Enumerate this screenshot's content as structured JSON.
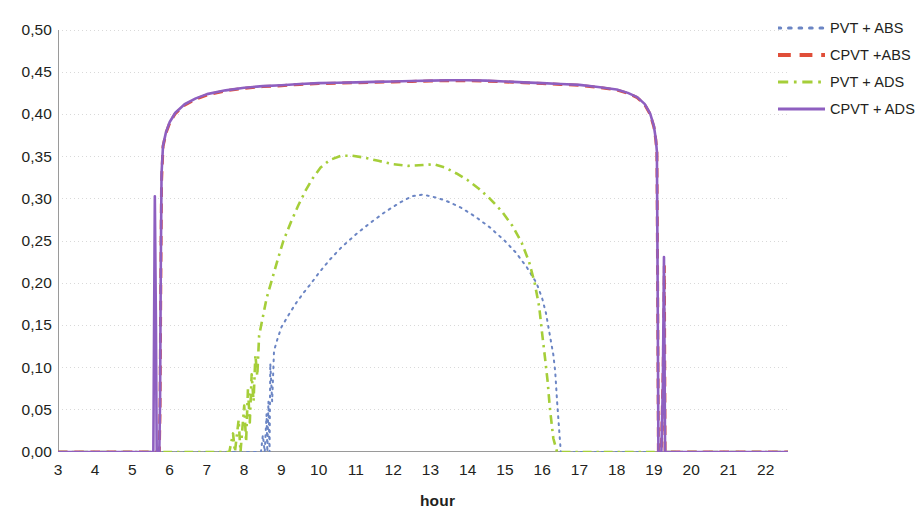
{
  "chart_data": {
    "type": "line",
    "title": "",
    "xlabel": "hour",
    "ylabel": "",
    "xlim": [
      3,
      22.6
    ],
    "ylim": [
      0,
      0.5
    ],
    "grid": true,
    "legend_position": "right",
    "decimal_separator": ",",
    "x_ticks": [
      3,
      4,
      5,
      6,
      7,
      8,
      9,
      10,
      11,
      12,
      13,
      14,
      15,
      16,
      17,
      18,
      19,
      20,
      21,
      22
    ],
    "x_tick_labels": [
      "3",
      "4",
      "5",
      "6",
      "7",
      "8",
      "9",
      "10",
      "11",
      "12",
      "13",
      "14",
      "15",
      "16",
      "17",
      "18",
      "19",
      "20",
      "21",
      "22"
    ],
    "x_minor_ticks_per_interval": 6,
    "y_ticks": [
      0.0,
      0.05,
      0.1,
      0.15,
      0.2,
      0.25,
      0.3,
      0.35,
      0.4,
      0.45,
      0.5
    ],
    "y_tick_labels": [
      "0,00",
      "0,05",
      "0,10",
      "0,15",
      "0,20",
      "0,25",
      "0,30",
      "0,35",
      "0,40",
      "0,45",
      "0,50"
    ],
    "series": [
      {
        "name": "PVT + ABS",
        "color": "#6b85c4",
        "style": "dotted",
        "width": 2.0,
        "points": [
          [
            3.0,
            0.0
          ],
          [
            5.0,
            0.0
          ],
          [
            6.0,
            0.0
          ],
          [
            7.0,
            0.0
          ],
          [
            8.0,
            0.0
          ],
          [
            8.45,
            0.0
          ],
          [
            8.5,
            0.02
          ],
          [
            8.55,
            0.0
          ],
          [
            8.6,
            0.045
          ],
          [
            8.62,
            0.0
          ],
          [
            8.65,
            0.06
          ],
          [
            8.68,
            0.0
          ],
          [
            8.7,
            0.105
          ],
          [
            8.75,
            0.06
          ],
          [
            8.8,
            0.12
          ],
          [
            8.9,
            0.135
          ],
          [
            9.0,
            0.148
          ],
          [
            9.2,
            0.163
          ],
          [
            9.4,
            0.177
          ],
          [
            9.6,
            0.189
          ],
          [
            9.8,
            0.2
          ],
          [
            10.0,
            0.212
          ],
          [
            10.3,
            0.228
          ],
          [
            10.6,
            0.242
          ],
          [
            11.0,
            0.258
          ],
          [
            11.4,
            0.272
          ],
          [
            11.8,
            0.285
          ],
          [
            12.2,
            0.296
          ],
          [
            12.5,
            0.303
          ],
          [
            12.8,
            0.305
          ],
          [
            13.1,
            0.302
          ],
          [
            13.4,
            0.298
          ],
          [
            13.8,
            0.29
          ],
          [
            14.2,
            0.279
          ],
          [
            14.6,
            0.266
          ],
          [
            15.0,
            0.25
          ],
          [
            15.3,
            0.236
          ],
          [
            15.6,
            0.218
          ],
          [
            15.85,
            0.2
          ],
          [
            16.0,
            0.182
          ],
          [
            16.1,
            0.165
          ],
          [
            16.2,
            0.14
          ],
          [
            16.3,
            0.115
          ],
          [
            16.35,
            0.095
          ],
          [
            16.4,
            0.06
          ],
          [
            16.45,
            0.03
          ],
          [
            16.5,
            0.0
          ],
          [
            17.0,
            0.0
          ],
          [
            19.0,
            0.0
          ],
          [
            22.6,
            0.0
          ]
        ]
      },
      {
        "name": "CPVT +ABS",
        "color": "#e04e39",
        "style": "dashed",
        "width": 3.0,
        "points": [
          [
            3.0,
            0.0
          ],
          [
            5.5,
            0.0
          ],
          [
            5.55,
            0.0
          ],
          [
            5.6,
            0.0
          ],
          [
            5.62,
            0.0
          ],
          [
            5.72,
            0.0
          ],
          [
            5.74,
            0.05
          ],
          [
            5.76,
            0.2
          ],
          [
            5.78,
            0.32
          ],
          [
            5.82,
            0.362
          ],
          [
            5.9,
            0.378
          ],
          [
            6.0,
            0.39
          ],
          [
            6.15,
            0.401
          ],
          [
            6.4,
            0.411
          ],
          [
            6.7,
            0.418
          ],
          [
            7.0,
            0.423
          ],
          [
            7.5,
            0.428
          ],
          [
            8.0,
            0.431
          ],
          [
            8.5,
            0.433
          ],
          [
            9.0,
            0.434
          ],
          [
            9.5,
            0.4355
          ],
          [
            10.0,
            0.4365
          ],
          [
            10.5,
            0.437
          ],
          [
            11.0,
            0.4375
          ],
          [
            11.5,
            0.438
          ],
          [
            12.0,
            0.4385
          ],
          [
            12.5,
            0.439
          ],
          [
            13.0,
            0.4395
          ],
          [
            13.5,
            0.44
          ],
          [
            14.0,
            0.44
          ],
          [
            14.5,
            0.4395
          ],
          [
            15.0,
            0.4385
          ],
          [
            15.5,
            0.4375
          ],
          [
            16.0,
            0.4365
          ],
          [
            16.5,
            0.4355
          ],
          [
            17.0,
            0.4345
          ],
          [
            17.5,
            0.432
          ],
          [
            18.0,
            0.429
          ],
          [
            18.3,
            0.425
          ],
          [
            18.55,
            0.42
          ],
          [
            18.75,
            0.412
          ],
          [
            18.9,
            0.4
          ],
          [
            19.0,
            0.385
          ],
          [
            19.05,
            0.37
          ],
          [
            19.08,
            0.355
          ],
          [
            19.1,
            0.2
          ],
          [
            19.12,
            0.0
          ],
          [
            19.2,
            0.0
          ],
          [
            19.25,
            0.1
          ],
          [
            19.28,
            0.22
          ],
          [
            19.3,
            0.0
          ],
          [
            19.5,
            0.0
          ],
          [
            20.0,
            0.0
          ],
          [
            22.6,
            0.0
          ]
        ]
      },
      {
        "name": "PVT + ADS",
        "color": "#a5ce39",
        "style": "dashdot",
        "width": 2.6,
        "points": [
          [
            3.0,
            0.0
          ],
          [
            6.0,
            0.0
          ],
          [
            7.0,
            0.0
          ],
          [
            7.6,
            0.0
          ],
          [
            7.7,
            0.022
          ],
          [
            7.75,
            0.0
          ],
          [
            7.85,
            0.038
          ],
          [
            7.9,
            0.0
          ],
          [
            8.0,
            0.055
          ],
          [
            8.05,
            0.012
          ],
          [
            8.1,
            0.075
          ],
          [
            8.15,
            0.035
          ],
          [
            8.2,
            0.092
          ],
          [
            8.25,
            0.06
          ],
          [
            8.3,
            0.115
          ],
          [
            8.35,
            0.09
          ],
          [
            8.4,
            0.138
          ],
          [
            8.5,
            0.16
          ],
          [
            8.6,
            0.182
          ],
          [
            8.75,
            0.205
          ],
          [
            8.9,
            0.228
          ],
          [
            9.05,
            0.25
          ],
          [
            9.25,
            0.272
          ],
          [
            9.45,
            0.292
          ],
          [
            9.65,
            0.31
          ],
          [
            9.85,
            0.325
          ],
          [
            10.05,
            0.337
          ],
          [
            10.3,
            0.346
          ],
          [
            10.6,
            0.351
          ],
          [
            10.9,
            0.351
          ],
          [
            11.2,
            0.349
          ],
          [
            11.6,
            0.345
          ],
          [
            12.0,
            0.341
          ],
          [
            12.4,
            0.339
          ],
          [
            12.8,
            0.34
          ],
          [
            13.1,
            0.341
          ],
          [
            13.4,
            0.337
          ],
          [
            13.7,
            0.33
          ],
          [
            14.0,
            0.322
          ],
          [
            14.3,
            0.312
          ],
          [
            14.6,
            0.3
          ],
          [
            14.9,
            0.286
          ],
          [
            15.2,
            0.268
          ],
          [
            15.45,
            0.248
          ],
          [
            15.65,
            0.225
          ],
          [
            15.8,
            0.2
          ],
          [
            15.92,
            0.172
          ],
          [
            16.0,
            0.14
          ],
          [
            16.08,
            0.11
          ],
          [
            16.15,
            0.082
          ],
          [
            16.2,
            0.055
          ],
          [
            16.25,
            0.035
          ],
          [
            16.3,
            0.016
          ],
          [
            16.4,
            0.0
          ],
          [
            17.0,
            0.0
          ],
          [
            19.0,
            0.0
          ],
          [
            22.6,
            0.0
          ]
        ]
      },
      {
        "name": "CPVT + ADS",
        "color": "#8e5fc0",
        "style": "solid",
        "width": 2.6,
        "points": [
          [
            3.0,
            0.0
          ],
          [
            5.5,
            0.0
          ],
          [
            5.56,
            0.0
          ],
          [
            5.58,
            0.15
          ],
          [
            5.6,
            0.303
          ],
          [
            5.63,
            0.15
          ],
          [
            5.65,
            0.0
          ],
          [
            5.72,
            0.0
          ],
          [
            5.74,
            0.06
          ],
          [
            5.76,
            0.22
          ],
          [
            5.78,
            0.33
          ],
          [
            5.82,
            0.363
          ],
          [
            5.9,
            0.379
          ],
          [
            6.0,
            0.391
          ],
          [
            6.15,
            0.402
          ],
          [
            6.4,
            0.412
          ],
          [
            6.7,
            0.419
          ],
          [
            7.0,
            0.424
          ],
          [
            7.5,
            0.4285
          ],
          [
            8.0,
            0.4315
          ],
          [
            8.5,
            0.4335
          ],
          [
            9.0,
            0.4345
          ],
          [
            9.5,
            0.436
          ],
          [
            10.0,
            0.437
          ],
          [
            10.5,
            0.4375
          ],
          [
            11.0,
            0.438
          ],
          [
            11.5,
            0.4385
          ],
          [
            12.0,
            0.439
          ],
          [
            12.5,
            0.4395
          ],
          [
            13.0,
            0.44
          ],
          [
            13.5,
            0.4405
          ],
          [
            14.0,
            0.4405
          ],
          [
            14.5,
            0.44
          ],
          [
            15.0,
            0.439
          ],
          [
            15.5,
            0.438
          ],
          [
            16.0,
            0.437
          ],
          [
            16.5,
            0.436
          ],
          [
            17.0,
            0.435
          ],
          [
            17.5,
            0.4325
          ],
          [
            18.0,
            0.4295
          ],
          [
            18.3,
            0.4255
          ],
          [
            18.55,
            0.4205
          ],
          [
            18.75,
            0.4125
          ],
          [
            18.9,
            0.401
          ],
          [
            19.0,
            0.386
          ],
          [
            19.05,
            0.371
          ],
          [
            19.08,
            0.356
          ],
          [
            19.1,
            0.2
          ],
          [
            19.12,
            0.0
          ],
          [
            19.2,
            0.0
          ],
          [
            19.24,
            0.08
          ],
          [
            19.27,
            0.231
          ],
          [
            19.3,
            0.0
          ],
          [
            19.5,
            0.0
          ],
          [
            20.0,
            0.0
          ],
          [
            21.0,
            0.0
          ],
          [
            22.6,
            0.0
          ]
        ]
      }
    ]
  },
  "legend": {
    "items": [
      {
        "label": "PVT + ABS",
        "color": "#6b85c4",
        "style": "dotted"
      },
      {
        "label": "CPVT +ABS",
        "color": "#e04e39",
        "style": "dashed"
      },
      {
        "label": "PVT + ADS",
        "color": "#a5ce39",
        "style": "dashdot"
      },
      {
        "label": "CPVT + ADS",
        "color": "#8e5fc0",
        "style": "solid"
      }
    ]
  },
  "axes": {
    "x_title": "hour",
    "grid_color": "#d9d9d9",
    "axis_color": "#9a9a9a",
    "text_color": "#231f20"
  }
}
